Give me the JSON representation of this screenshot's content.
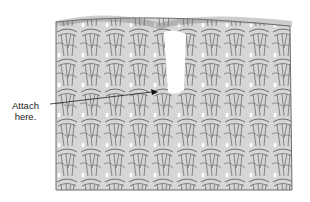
{
  "diagram": {
    "annotation": {
      "line1": "Attach",
      "line2": "here."
    },
    "colors": {
      "yarn_fill": "#d6d6d6",
      "yarn_outline": "#6f6f6f",
      "background": "#ffffff",
      "text": "#222222"
    }
  }
}
